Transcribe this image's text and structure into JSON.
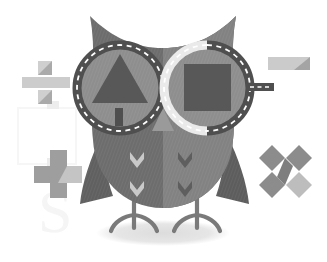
{
  "scene": {
    "title": "Owl with road-ring spectacles illustration",
    "width": 327,
    "height": 262,
    "background_color": "#ffffff",
    "style": "flat vector illustration, grayscale, subtle cross-hatch texture"
  },
  "palette": {
    "background": "#ffffff",
    "body_dark": "#6e6e6e",
    "body_mid": "#7b7b7b",
    "body_light": "#8d8d8d",
    "wing_dark": "#646464",
    "eye_disc": "#8a8a8a",
    "ring_dark": "#555555",
    "ring_light": "#e8e8e8",
    "ring_dash": "#ffffff",
    "shape_dark": "#585858",
    "chevron_light": "#c9c9c9",
    "chevron_dark": "#5c5c5c",
    "leg_gray": "#787878",
    "shadow_gray": "#e3e3e3",
    "symbol_light": "#c9c9c9",
    "symbol_mid": "#9a9a9a",
    "symbol_dark": "#8a8a8a",
    "watermark": "#f4f4f4"
  },
  "owl": {
    "label": "owl",
    "parts": [
      {
        "name": "head-with-ear-tufts",
        "label": "Head with two pointed ear tufts"
      },
      {
        "name": "body",
        "label": "Rounded body, split into darker left and lighter right halves"
      },
      {
        "name": "left-wing",
        "label": "Left wing, pointed, dark gray"
      },
      {
        "name": "right-wing",
        "label": "Right wing, pointed, dark gray"
      },
      {
        "name": "beak",
        "label": "Small light triangular beak between the eyes"
      },
      {
        "name": "left-leg",
        "label": "Left leg with three toes"
      },
      {
        "name": "right-leg",
        "label": "Right leg with three toes"
      },
      {
        "name": "ground-shadow",
        "label": "Soft elliptical shadow under the owl"
      }
    ],
    "left_eye": {
      "name": "left-eye",
      "label": "Left eye: dark dashed road ring with triangular road sign inside",
      "ring_style": "solid dark ring with white dashed centre line",
      "inner_shapes": [
        {
          "name": "triangle-sign",
          "label": "Triangle sign"
        },
        {
          "name": "sign-post",
          "label": "Sign post"
        }
      ]
    },
    "right_eye": {
      "name": "right-eye",
      "label": "Right eye: two-tone road ring (light left half, dark right half) with square sign inside",
      "ring_style": "half light, half dark ring with white dashed centre line",
      "inner_shapes": [
        {
          "name": "square-sign",
          "label": "Square sign"
        }
      ],
      "road_stub": {
        "name": "road-stub",
        "label": "Short dashed road branching right"
      }
    },
    "belly_chevrons": [
      {
        "name": "chevron-left-upper",
        "tone": "light"
      },
      {
        "name": "chevron-left-lower",
        "tone": "light"
      },
      {
        "name": "chevron-right-upper",
        "tone": "dark"
      },
      {
        "name": "chevron-right-lower",
        "tone": "dark"
      }
    ]
  },
  "math_symbols": [
    {
      "name": "divide-symbol",
      "label": "Division sign",
      "glyph": "÷",
      "position": "upper left",
      "x": 20,
      "y": 58
    },
    {
      "name": "plus-symbol",
      "label": "Plus sign",
      "glyph": "+",
      "position": "lower left",
      "x": 30,
      "y": 145
    },
    {
      "name": "minus-symbol",
      "label": "Minus sign",
      "glyph": "−",
      "position": "upper right",
      "x": 266,
      "y": 55
    },
    {
      "name": "multiply-symbol",
      "label": "Multiplication sign",
      "glyph": "×",
      "position": "lower right",
      "x": 262,
      "y": 140
    }
  ],
  "watermark": {
    "name": "watermark",
    "label": "Faint watermark letter",
    "text": "S"
  }
}
